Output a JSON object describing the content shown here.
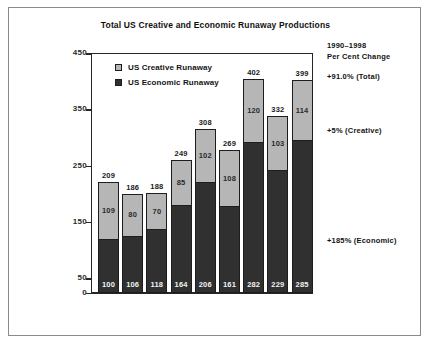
{
  "chart_data": {
    "type": "bar",
    "subtype": "stacked-bar",
    "title": "Total US Creative and Economic Runaway Productions",
    "xlabel": "",
    "ylabel": "",
    "ylim": [
      0,
      450
    ],
    "yticks": [
      0,
      50,
      150,
      250,
      350,
      450
    ],
    "grid": false,
    "legend_position": "inside-top-left",
    "categories": [
      "1990",
      "1991",
      "1992",
      "1993",
      "1994",
      "1995",
      "1996",
      "1997",
      "1998"
    ],
    "series": [
      {
        "name": "US Economic Runaway",
        "color": "#303030",
        "values": [
          100,
          106,
          118,
          164,
          206,
          161,
          282,
          229,
          285
        ]
      },
      {
        "name": "US Creative Runaway",
        "color": "#b6b6b6",
        "values": [
          109,
          80,
          70,
          85,
          102,
          108,
          120,
          103,
          114
        ]
      }
    ],
    "totals": [
      209,
      186,
      188,
      249,
      308,
      269,
      402,
      332,
      399
    ]
  },
  "legend": {
    "items": [
      {
        "label": "US Creative Runaway",
        "swatch": "creative"
      },
      {
        "label": "US Economic Runaway",
        "swatch": "economic"
      }
    ]
  },
  "annotations": {
    "heading_line1": "1990–1998",
    "heading_line2": "Per Cent Change",
    "total_change": "+91.0% (Total)",
    "creative_change": "+5% (Creative)",
    "economic_change": "+185% (Economic)"
  },
  "colors": {
    "creative": "#b6b6b6",
    "economic": "#303030",
    "axis": "#262626",
    "border": "#8a8a8a"
  }
}
